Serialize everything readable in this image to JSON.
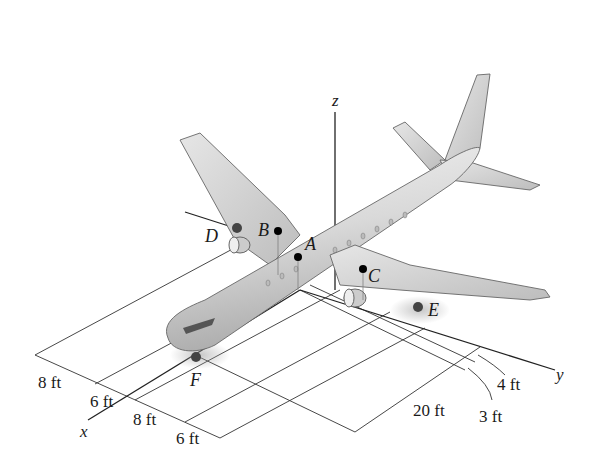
{
  "figure": {
    "axes": {
      "x": "x",
      "y": "y",
      "z": "z"
    },
    "points": {
      "A": "A",
      "B": "B",
      "C": "C",
      "D": "D",
      "E": "E",
      "F": "F"
    },
    "dimensions_x_side": [
      "8 ft",
      "6 ft",
      "8 ft",
      "6 ft"
    ],
    "dimensions_y_side": [
      "20 ft",
      "4 ft",
      "3 ft"
    ]
  }
}
